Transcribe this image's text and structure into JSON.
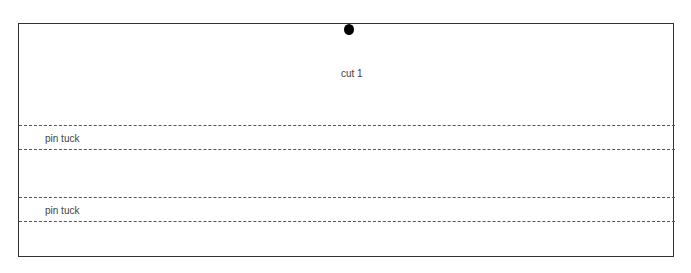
{
  "pattern": {
    "instruction": "cut 1",
    "marker": "notch-dot",
    "tucks": [
      {
        "label": "pin tuck",
        "line_top_y": 125,
        "line_bottom_y": 149,
        "label_y": 134
      },
      {
        "label": "pin tuck",
        "line_top_y": 197,
        "line_bottom_y": 221,
        "label_y": 206
      }
    ],
    "colors": {
      "outline": "#333333",
      "dash": "#555555",
      "dot": "#000000"
    }
  }
}
